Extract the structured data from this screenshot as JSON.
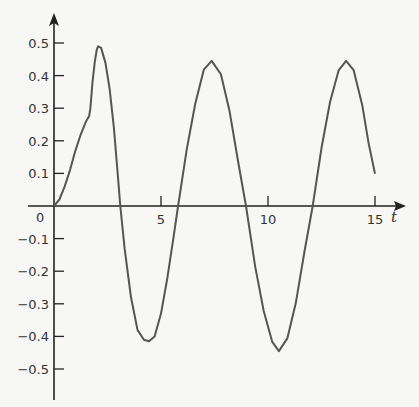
{
  "chart_data": {
    "type": "line",
    "title": "",
    "xlabel": "t",
    "ylabel": "",
    "xlim": [
      0,
      15
    ],
    "ylim": [
      -0.55,
      0.55
    ],
    "grid": false,
    "legend": null,
    "x_ticks": [
      0,
      5,
      10,
      15
    ],
    "x_tick_labels": [
      "0",
      "5",
      "10",
      "15"
    ],
    "y_ticks": [
      0.5,
      0.4,
      0.3,
      0.2,
      0.1,
      -0.1,
      -0.2,
      -0.3,
      -0.4,
      -0.5
    ],
    "y_tick_labels": [
      "0.5",
      "0.4",
      "0.3",
      "0.2",
      "0.1",
      "-0.1",
      "-0.2",
      "-0.3",
      "-0.4",
      "-0.5"
    ],
    "series": [
      {
        "name": "y(t)",
        "color": "#555555",
        "x": [
          0,
          0.25,
          0.5,
          0.75,
          1.0,
          1.25,
          1.5,
          1.64,
          1.7,
          1.8,
          1.9,
          2.0,
          2.06,
          2.2,
          2.4,
          2.6,
          2.8,
          3.0,
          3.1,
          3.3,
          3.6,
          3.9,
          4.2,
          4.44,
          4.7,
          5.0,
          5.3,
          5.6,
          5.8,
          6.2,
          6.6,
          7.0,
          7.37,
          7.8,
          8.2,
          8.6,
          8.97,
          9.4,
          9.8,
          10.2,
          10.51,
          10.9,
          11.3,
          11.7,
          12.09,
          12.5,
          12.9,
          13.3,
          13.65,
          14.0,
          14.4,
          14.7,
          15.0
        ],
        "y": [
          0,
          0.02,
          0.06,
          0.11,
          0.17,
          0.22,
          0.26,
          0.275,
          0.3,
          0.38,
          0.44,
          0.48,
          0.49,
          0.485,
          0.44,
          0.36,
          0.24,
          0.08,
          0.0,
          -0.13,
          -0.28,
          -0.38,
          -0.41,
          -0.415,
          -0.4,
          -0.33,
          -0.22,
          -0.09,
          0.0,
          0.173,
          0.313,
          0.418,
          0.445,
          0.404,
          0.292,
          0.138,
          0.0,
          -0.186,
          -0.322,
          -0.417,
          -0.445,
          -0.406,
          -0.298,
          -0.141,
          0.0,
          0.178,
          0.32,
          0.416,
          0.445,
          0.417,
          0.31,
          0.193,
          0.099
        ]
      }
    ],
    "annotations": [
      "kink at t≈1.64, y≈0.275"
    ]
  },
  "axes": {
    "x_label": "t",
    "origin_label": "0",
    "axis_color": "#222222"
  }
}
